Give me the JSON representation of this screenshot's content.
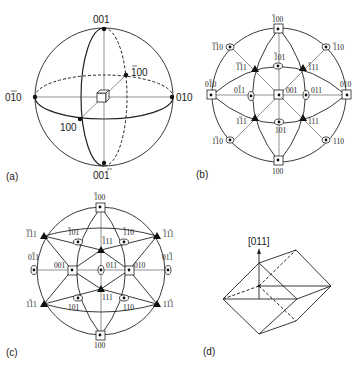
{
  "figure": {
    "panels": [
      {
        "id": "a",
        "label": "(a)",
        "description": "Reference sphere with cubic crystal at center",
        "points": {
          "top": {
            "label": "001"
          },
          "bottom": {
            "label": "001",
            "bar": [
              2
            ]
          },
          "left": {
            "label": "010",
            "bar": [
              1
            ]
          },
          "right": {
            "label": "010"
          },
          "front": {
            "label": "100"
          },
          "back": {
            "label": "100",
            "bar": [
              0
            ]
          }
        }
      },
      {
        "id": "b",
        "label": "(b)",
        "description": "Stereographic projection viewed along [001]",
        "points": [
          {
            "label": "100",
            "bar": [
              0
            ],
            "pos": "top"
          },
          {
            "label": "100",
            "bar": [],
            "pos": "bottom"
          },
          {
            "label": "010",
            "bar": [
              1
            ],
            "pos": "left"
          },
          {
            "label": "010",
            "bar": [],
            "pos": "right"
          },
          {
            "label": "001",
            "bar": [],
            "pos": "center"
          },
          {
            "label": "110",
            "bar": [
              0,
              1
            ],
            "pos": "upper-left-rim"
          },
          {
            "label": "110",
            "bar": [
              0
            ],
            "pos": "upper-right-rim"
          },
          {
            "label": "110",
            "bar": [
              1
            ],
            "pos": "lower-left-rim"
          },
          {
            "label": "110",
            "bar": [],
            "pos": "lower-right-rim"
          },
          {
            "label": "111",
            "bar": [
              0,
              1
            ],
            "pos": "inner-upper-left"
          },
          {
            "label": "111",
            "bar": [
              0
            ],
            "pos": "inner-upper-right"
          },
          {
            "label": "111",
            "bar": [
              1
            ],
            "pos": "inner-lower-left"
          },
          {
            "label": "111",
            "bar": [],
            "pos": "inner-lower-right"
          },
          {
            "label": "101",
            "bar": [
              0
            ],
            "pos": "inner-top"
          },
          {
            "label": "101",
            "bar": [],
            "pos": "inner-bottom"
          },
          {
            "label": "011",
            "bar": [
              1
            ],
            "pos": "inner-left"
          },
          {
            "label": "011",
            "bar": [],
            "pos": "inner-right"
          }
        ]
      },
      {
        "id": "c",
        "label": "(c)",
        "description": "Stereographic projection viewed along [011]",
        "points": [
          {
            "label": "100",
            "bar": [
              0
            ],
            "pos": "top"
          },
          {
            "label": "100",
            "bar": [],
            "pos": "bottom"
          },
          {
            "label": "111",
            "bar": [
              0,
              1
            ],
            "pos": "rim-upper-left"
          },
          {
            "label": "111",
            "bar": [
              0,
              2
            ],
            "pos": "rim-upper-right"
          },
          {
            "label": "111",
            "bar": [
              1
            ],
            "pos": "rim-lower-left"
          },
          {
            "label": "111",
            "bar": [
              2
            ],
            "pos": "rim-lower-right"
          },
          {
            "label": "011",
            "bar": [
              1
            ],
            "pos": "rim-left"
          },
          {
            "label": "011",
            "bar": [
              2
            ],
            "pos": "rim-right"
          },
          {
            "label": "101",
            "bar": [
              0
            ],
            "pos": "upper-left"
          },
          {
            "label": "110",
            "bar": [
              0
            ],
            "pos": "upper-right"
          },
          {
            "label": "111",
            "bar": [
              0
            ],
            "pos": "upper-center"
          },
          {
            "label": "001",
            "bar": [],
            "pos": "mid-left"
          },
          {
            "label": "011",
            "bar": [],
            "pos": "center"
          },
          {
            "label": "010",
            "bar": [],
            "pos": "mid-right"
          },
          {
            "label": "111",
            "bar": [],
            "pos": "lower-center"
          },
          {
            "label": "101",
            "bar": [],
            "pos": "lower-left"
          },
          {
            "label": "110",
            "bar": [],
            "pos": "lower-right"
          }
        ]
      },
      {
        "id": "d",
        "label": "(d)",
        "description": "Rhombohedral unit viewed with [011] axis",
        "axis_label": "[011]"
      }
    ]
  },
  "labels": {
    "a": {
      "panel": "(a)",
      "top": "001",
      "bottom": "001",
      "left": "010",
      "right": "010",
      "front": "100",
      "back": "100"
    },
    "b": {
      "panel": "(b)",
      "top": "100",
      "bottom": "100",
      "left": "010",
      "right": "010",
      "center": "001",
      "rim_ul": "110",
      "rim_ur": "110",
      "rim_ll": "110",
      "rim_lr": "110",
      "in_ul": "111",
      "in_ur": "111",
      "in_ll": "111",
      "in_lr": "111",
      "in_t": "101",
      "in_b": "101",
      "in_l": "011",
      "in_r": "011"
    },
    "c": {
      "panel": "(c)",
      "top": "100",
      "bottom": "100",
      "rim_ul": "111",
      "rim_ur": "111",
      "rim_ll": "111",
      "rim_lr": "111",
      "rim_l": "011",
      "rim_r": "011",
      "ul": "101",
      "ur": "110",
      "uc": "111",
      "ml": "001",
      "c": "011",
      "mr": "010",
      "lc": "111",
      "ll": "101",
      "lr": "110"
    },
    "d": {
      "panel": "(d)",
      "axis": "[011]"
    }
  }
}
